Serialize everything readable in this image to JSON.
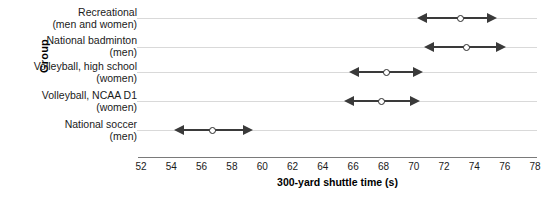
{
  "chart_data": {
    "type": "scatter",
    "title": "",
    "xlabel": "300-yard shuttle time (s)",
    "ylabel": "Group",
    "xlim": [
      52,
      78
    ],
    "xticks": [
      52,
      54,
      56,
      58,
      60,
      62,
      64,
      66,
      68,
      70,
      72,
      74,
      76,
      78
    ],
    "grid": true,
    "legend": "none",
    "orientation": "horizontal",
    "categories": [
      "Recreational\n(men and women)",
      "National badminton\n(men)",
      "Volleyball, high school\n(women)",
      "Volleyball, NCAA D1\n(women)",
      "National soccer\n(men)"
    ],
    "values": [
      73.1,
      73.5,
      68.2,
      67.9,
      56.7
    ],
    "intervals": [
      {
        "low": 70.2,
        "high": 75.5
      },
      {
        "low": 70.7,
        "high": 76.1
      },
      {
        "low": 65.7,
        "high": 70.6
      },
      {
        "low": 65.4,
        "high": 70.4
      },
      {
        "low": 54.2,
        "high": 59.4
      }
    ],
    "marker": "open-circle",
    "interval_cap": "arrow",
    "colors": {
      "line": "#3a3a3a",
      "marker_fill": "#ffffff",
      "marker_edge": "#2a2a2a",
      "grid": "#d9d9d9",
      "axis": "#7a7a7a"
    }
  },
  "caption": {
    "text": ""
  }
}
